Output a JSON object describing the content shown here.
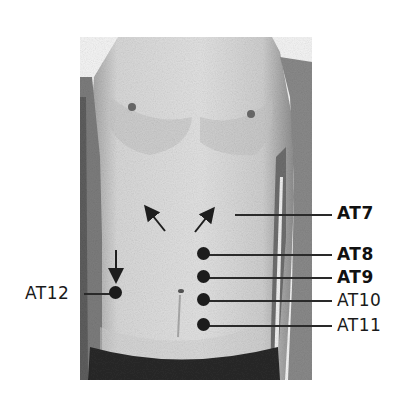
{
  "figure": {
    "points": [
      {
        "id": "AT7",
        "label": "AT7",
        "bold": true,
        "dot": false,
        "label_x": 337,
        "label_y": 205,
        "line_x1": 235,
        "line_x2": 332,
        "line_y": 214
      },
      {
        "id": "AT8",
        "label": "AT8",
        "bold": true,
        "dot": true,
        "dot_x": 204,
        "dot_y": 254,
        "label_x": 337,
        "label_y": 246,
        "line_x1": 210,
        "line_x2": 332,
        "line_y": 254
      },
      {
        "id": "AT9",
        "label": "AT9",
        "bold": true,
        "dot": true,
        "dot_x": 204,
        "dot_y": 277,
        "label_x": 337,
        "label_y": 269,
        "line_x1": 210,
        "line_x2": 332,
        "line_y": 277
      },
      {
        "id": "AT10",
        "label": "AT10",
        "bold": false,
        "dot": true,
        "dot_x": 204,
        "dot_y": 300,
        "label_x": 337,
        "label_y": 292,
        "line_x1": 210,
        "line_x2": 332,
        "line_y": 300
      },
      {
        "id": "AT11",
        "label": "AT11",
        "bold": false,
        "dot": true,
        "dot_x": 204,
        "dot_y": 325,
        "label_x": 337,
        "label_y": 317,
        "line_x1": 210,
        "line_x2": 332,
        "line_y": 325
      },
      {
        "id": "AT12",
        "label": "AT12",
        "bold": false,
        "dot": true,
        "dot_x": 115,
        "dot_y": 293,
        "label_x": 25,
        "label_y": 285,
        "line_x1": 84,
        "line_x2": 112,
        "line_y": 293
      }
    ],
    "arrows": [
      {
        "name": "arrow-up-left",
        "x1": 165,
        "y1": 231,
        "x2": 148,
        "y2": 210
      },
      {
        "name": "arrow-up-right",
        "x1": 195,
        "y1": 232,
        "x2": 211,
        "y2": 212
      },
      {
        "name": "arrow-down",
        "x1": 116,
        "y1": 250,
        "x2": 116,
        "y2": 277
      }
    ]
  }
}
